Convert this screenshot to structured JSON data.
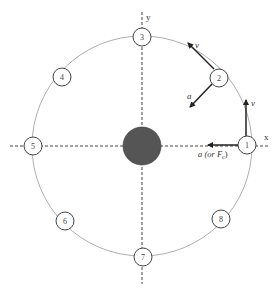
{
  "diagram": {
    "title": "",
    "axes": {
      "x_label": "x",
      "y_label": "y"
    },
    "central_body": {
      "color": "#555555"
    },
    "orbit": {
      "color": "#999999"
    },
    "positions": [
      {
        "label": "1"
      },
      {
        "label": "2"
      },
      {
        "label": "3"
      },
      {
        "label": "4"
      },
      {
        "label": "5"
      },
      {
        "label": "6"
      },
      {
        "label": "7"
      },
      {
        "label": "8"
      }
    ],
    "vectors": {
      "pos1_velocity": "v",
      "pos1_acceleration": "a (or F",
      "pos1_acceleration_sub": "c",
      "pos1_acceleration_close": ")",
      "pos2_velocity": "v",
      "pos2_acceleration": "a"
    }
  }
}
